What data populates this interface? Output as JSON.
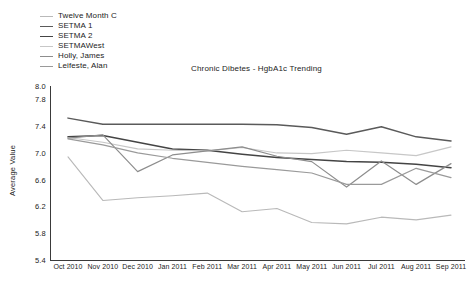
{
  "chart_data": {
    "type": "line",
    "title": "Chronic Dibetes - HgbA1c Trending",
    "xlabel": "",
    "ylabel": "Average Value",
    "ylim": [
      5.4,
      8.0
    ],
    "yticks": [
      8.0,
      7.8,
      7.4,
      7.0,
      6.6,
      6.2,
      5.8,
      5.4
    ],
    "ytick_labels": [
      "8.0",
      "7.8",
      "7.4",
      "7.0",
      "6.6",
      "6.2",
      "5.8",
      "5.4"
    ],
    "grid": false,
    "legend_position": "top-left",
    "categories": [
      "Oct 2010",
      "Nov 2010",
      "Dec 2010",
      "Jan 2011",
      "Feb 2011",
      "Mar 2011",
      "Apr 2011",
      "May 2011",
      "Jun 2011",
      "Jul 2011",
      "Aug 2011",
      "Sep 2011"
    ],
    "series": [
      {
        "name": "Twelve Month C",
        "color": "#b9b9b9",
        "width": 1.1,
        "values": [
          6.94,
          6.29,
          6.33,
          6.36,
          6.4,
          6.12,
          6.17,
          5.96,
          5.94,
          6.04,
          6.0,
          6.07
        ]
      },
      {
        "name": "SETMA 1",
        "color": "#5a5a5a",
        "width": 1.5,
        "values": [
          7.52,
          7.43,
          7.43,
          7.43,
          7.43,
          7.43,
          7.42,
          7.38,
          7.28,
          7.39,
          7.24,
          7.18
        ]
      },
      {
        "name": "SETMA 2",
        "color": "#444444",
        "width": 1.5,
        "values": [
          7.24,
          7.26,
          7.16,
          7.06,
          7.04,
          6.98,
          6.93,
          6.9,
          6.87,
          6.86,
          6.83,
          6.78
        ]
      },
      {
        "name": "SETMAWest",
        "color": "#c7c7c7",
        "width": 1.1,
        "values": [
          7.23,
          7.16,
          7.06,
          7.04,
          7.03,
          7.08,
          7.0,
          6.99,
          7.04,
          7.0,
          6.96,
          7.09
        ]
      },
      {
        "name": "Holly, James",
        "color": "#8d8d8d",
        "width": 1.2,
        "values": [
          7.22,
          7.27,
          6.72,
          6.97,
          7.03,
          7.09,
          6.95,
          6.87,
          6.49,
          6.88,
          6.53,
          6.84
        ]
      },
      {
        "name": "Leifeste, Alan",
        "color": "#9a9a9a",
        "width": 1.2,
        "values": [
          7.21,
          7.12,
          7.0,
          6.92,
          6.86,
          6.8,
          6.75,
          6.7,
          6.53,
          6.53,
          6.77,
          6.63
        ]
      }
    ]
  },
  "legend": {
    "items": [
      {
        "label": "Twelve Month C"
      },
      {
        "label": "SETMA 1"
      },
      {
        "label": "SETMA 2"
      },
      {
        "label": "SETMAWest"
      },
      {
        "label": "Holly, James"
      },
      {
        "label": "Leifeste, Alan"
      }
    ]
  }
}
